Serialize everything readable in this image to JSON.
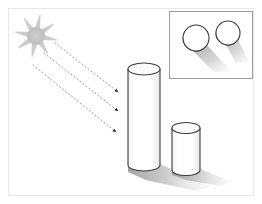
{
  "figure": {
    "canvas": {
      "width": 262,
      "height": 204,
      "background": "#ffffff"
    },
    "frame": {
      "name": "outer-frame",
      "x": 8,
      "y": 8,
      "width": 246,
      "height": 188,
      "stroke": "#e8e8e8",
      "stroke_width": 1,
      "fill": "#ffffff"
    },
    "sun": {
      "label": "sun",
      "center_x": 36,
      "center_y": 36,
      "core_radius": 9,
      "ray_count": 8,
      "ray_length": 20,
      "ray_width": 6,
      "color": "#c9c9c9",
      "core_color": "#c2c2c2"
    },
    "light_rays": [
      {
        "name": "light-ray-1",
        "x1": 55,
        "y1": 43,
        "x2": 118,
        "y2": 92,
        "style": "dotted",
        "color": "#9a9a9a",
        "arrowhead": "triangle"
      },
      {
        "name": "light-ray-2",
        "x1": 44,
        "y1": 53,
        "x2": 118,
        "y2": 111,
        "style": "dotted",
        "color": "#9a9a9a",
        "arrowhead": "triangle"
      },
      {
        "name": "light-ray-3",
        "x1": 33,
        "y1": 65,
        "x2": 116,
        "y2": 132,
        "style": "dotted",
        "color": "#9a9a9a",
        "arrowhead": "triangle"
      }
    ],
    "cylinders": [
      {
        "name": "tall-cylinder",
        "cx": 144,
        "top_y": 69,
        "bottom_y": 165,
        "rx": 16,
        "ry": 6,
        "fill": "#ffffff",
        "stroke": "#3a3a3a",
        "stroke_width": 1.1,
        "top_fill": "#fbfbfb"
      },
      {
        "name": "short-cylinder",
        "cx": 186,
        "top_y": 128,
        "bottom_y": 170,
        "rx": 14,
        "ry": 5.5,
        "fill": "#ffffff",
        "stroke": "#3a3a3a",
        "stroke_width": 1.1,
        "top_fill": "#fbfbfb"
      }
    ],
    "shadows": [
      {
        "name": "tall-cylinder-shadow",
        "points": "128,166 160,164 212,186 196,191 146,180 128,172",
        "gradient": "shadow-grad-main",
        "opacity": 0.85
      },
      {
        "name": "short-cylinder-shadow",
        "points": "172,170 200,169 233,182 221,186 186,180 172,175",
        "gradient": "shadow-grad-main",
        "opacity": 0.8
      }
    ],
    "inset": {
      "name": "top-view-inset",
      "x": 169,
      "y": 11,
      "width": 84,
      "height": 68,
      "fill": "#ffffff",
      "stroke": "#9b9b9b",
      "stroke_width": 1,
      "circles": [
        {
          "name": "inset-circle-tall",
          "cx": 196,
          "cy": 38,
          "r": 13,
          "fill": "#ffffff",
          "stroke": "#3a3a3a",
          "stroke_width": 1.1,
          "side_band": true
        },
        {
          "name": "inset-circle-short",
          "cx": 228,
          "cy": 33,
          "r": 12,
          "fill": "#ffffff",
          "stroke": "#3a3a3a",
          "stroke_width": 1.1,
          "side_band": true
        }
      ],
      "shadows": [
        {
          "name": "inset-shadow-tall",
          "points": "192,50 206,44 232,72 214,72",
          "opacity": 0.8
        },
        {
          "name": "inset-shadow-short",
          "points": "226,45 238,40 250,62 236,63",
          "opacity": 0.65
        }
      ]
    },
    "palette": {
      "outline": "#3a3a3a",
      "shadow_dark": "#8d8d8d",
      "shadow_light": "#e6e6e6",
      "sun": "#c9c9c9",
      "ray": "#9a9a9a",
      "frame": "#e8e8e8",
      "inset_border": "#9b9b9b",
      "background": "#ffffff"
    }
  }
}
